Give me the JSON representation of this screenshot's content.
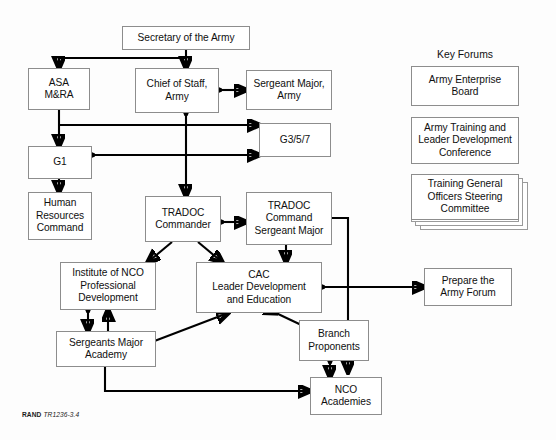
{
  "figure": {
    "caption_prefix": "RAND",
    "caption_id": "TR1236-3.4"
  },
  "key_forums": {
    "title": "Key Forums",
    "items": [
      {
        "label": "Army Enterprise\nBoard"
      },
      {
        "label": "Army Training and\nLeader Development\nConference"
      },
      {
        "label": "Training General\nOfficers Steering\nCommittee"
      }
    ],
    "supporting_label": "Supporting forums"
  },
  "nodes": {
    "secretary": "Secretary of the Army",
    "asa": "ASA\nM&RA",
    "chief_of_staff": "Chief of Staff,\nArmy",
    "sergeant_major_army": "Sergeant Major,\nArmy",
    "g357": "G3/5/7",
    "g1": "G1",
    "human_resources": "Human\nResources\nCommand",
    "tradoc_commander": "TRADOC\nCommander",
    "tradoc_csm": "TRADOC\nCommand\nSergeant Major",
    "institute_nco": "Institute of NCO\nProfessional\nDevelopment",
    "cac": "CAC\nLeader Development\nand Education",
    "prepare_army_forum": "Prepare the\nArmy Forum",
    "sergeants_major_academy": "Sergeants Major\nAcademy",
    "branch_proponents": "Branch\nProponents",
    "nco_academies": "NCO\nAcademies"
  },
  "colors": {
    "box_border": "#8d8d8d",
    "connector": "#000000",
    "background": "#fdfdfd",
    "text": "#101010"
  }
}
